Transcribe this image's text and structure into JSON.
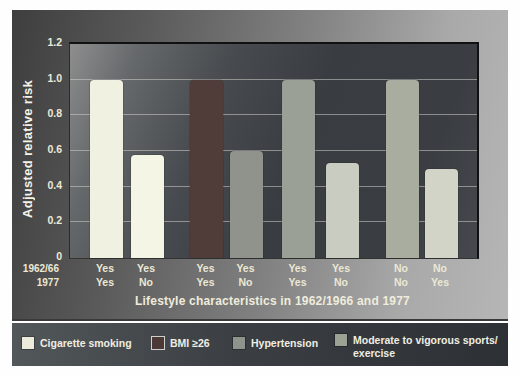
{
  "figure": {
    "y_axis_title": "Adjusted relative risk",
    "x_axis_title": "Lifestyle characteristics in 1962/1966 and 1977",
    "row_headers": [
      "1962/66",
      "1977"
    ]
  },
  "chart_data": {
    "type": "bar",
    "title": "",
    "ylabel": "Adjusted relative risk",
    "xlabel": "Lifestyle characteristics in 1962/1966 and 1977",
    "ylim": [
      0,
      1.2
    ],
    "grid": true,
    "yticks": [
      {
        "label": "0",
        "value": 0
      },
      {
        "label": "0.2",
        "value": 0.2
      },
      {
        "label": "0.4",
        "value": 0.4
      },
      {
        "label": "0.6",
        "value": 0.6
      },
      {
        "label": "0.8",
        "value": 0.8
      },
      {
        "label": "1.0",
        "value": 1.0
      },
      {
        "label": "1.2",
        "value": 1.2
      }
    ],
    "row_headers": [
      "1962/66",
      "1977"
    ],
    "bars": [
      {
        "group": "Cigarette smoking",
        "label_1962_66": "Yes",
        "label_1977": "Yes",
        "value": 1.0,
        "color": "#f1f1e1"
      },
      {
        "group": "Cigarette smoking",
        "label_1962_66": "Yes",
        "label_1977": "No",
        "value": 0.58,
        "color": "#f5f5e6"
      },
      {
        "group": "BMI ≥26",
        "label_1962_66": "Yes",
        "label_1977": "Yes",
        "value": 1.0,
        "color": "#503c39"
      },
      {
        "group": "BMI ≥26",
        "label_1962_66": "Yes",
        "label_1977": "No",
        "value": 0.6,
        "color": "#8f938b"
      },
      {
        "group": "Hypertension",
        "label_1962_66": "Yes",
        "label_1977": "Yes",
        "value": 1.0,
        "color": "#9ba096"
      },
      {
        "group": "Hypertension",
        "label_1962_66": "Yes",
        "label_1977": "No",
        "value": 0.53,
        "color": "#c8ccc1"
      },
      {
        "group": "Moderate to vigorous sports/exercise",
        "label_1962_66": "No",
        "label_1977": "No",
        "value": 1.0,
        "color": "#a9ad9f"
      },
      {
        "group": "Moderate to vigorous sports/exercise",
        "label_1962_66": "No",
        "label_1977": "Yes",
        "value": 0.5,
        "color": "#d2d4c7"
      }
    ],
    "legend": [
      {
        "lines": [
          "Cigarette smoking"
        ],
        "color": "#eceadb",
        "border": ""
      },
      {
        "lines": [
          "BMI ≥26"
        ],
        "color": "#4a3937",
        "border": "#cfcfcf"
      },
      {
        "lines": [
          "Hypertension"
        ],
        "color": "#8e948b",
        "border": ""
      },
      {
        "lines": [
          "Moderate to vigorous sports/",
          "exercise"
        ],
        "color": "#9ca294",
        "border": ""
      }
    ],
    "legend_position": "bottom"
  }
}
